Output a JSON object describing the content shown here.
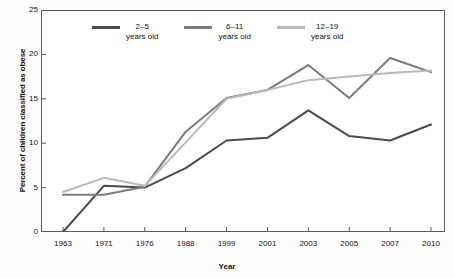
{
  "chart_data": {
    "type": "line",
    "title": "",
    "xlabel": "Year",
    "ylabel": "Percent of children classified as obese",
    "categories": [
      "1963",
      "1971",
      "1976",
      "1988",
      "1999",
      "2001",
      "2003",
      "2005",
      "2007",
      "2010"
    ],
    "ylim": [
      0,
      25
    ],
    "yticks": [
      0,
      5,
      10,
      15,
      20,
      25
    ],
    "grid": false,
    "legend_position": "top-center",
    "series": [
      {
        "name": "2–5 years old",
        "legend_label_line1": "2–5",
        "legend_label_line2": "years old",
        "color": "#4a4a52",
        "values": [
          0.0,
          5.2,
          5.0,
          7.2,
          10.3,
          10.6,
          13.7,
          10.8,
          10.3,
          12.1
        ]
      },
      {
        "name": "6–11 years old",
        "legend_label_line1": "6–11",
        "legend_label_line2": "years old",
        "color": "#7b7b85",
        "values": [
          4.2,
          4.2,
          5.1,
          11.3,
          15.1,
          16.0,
          18.8,
          15.1,
          19.6,
          18.0
        ]
      },
      {
        "name": "12–19 years old",
        "legend_label_line1": "12–19",
        "legend_label_line2": "years old",
        "color": "#b9b9bf",
        "values": [
          4.5,
          6.1,
          5.2,
          10.1,
          15.0,
          16.0,
          17.1,
          17.5,
          17.9,
          18.2
        ]
      }
    ],
    "axis_color": "#5a5a64",
    "background": "#ffffff"
  }
}
